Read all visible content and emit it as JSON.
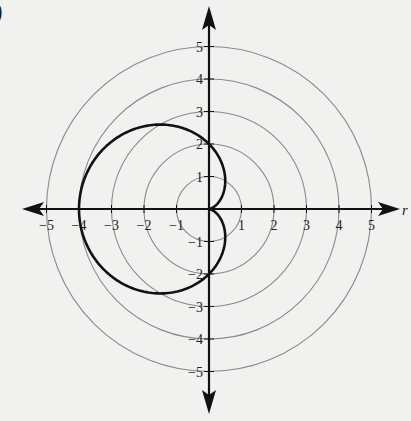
{
  "panel": {
    "label": ")"
  },
  "chart_data": {
    "type": "line",
    "subtype": "polar",
    "title": "",
    "equation": "r = 2 - 2cos(theta)",
    "curve_name": "cardioid",
    "xlabel": "r",
    "ylabel": "",
    "xlim": [
      -5,
      5
    ],
    "ylim": [
      -5,
      5
    ],
    "grid": "concentric circles r = 1..5",
    "grid_circles": [
      1,
      2,
      3,
      4,
      5
    ],
    "x_ticks": [
      -5,
      -4,
      -3,
      -2,
      -1,
      1,
      2,
      3,
      4,
      5
    ],
    "y_ticks": [
      -5,
      -4,
      -3,
      -2,
      -1,
      1,
      2,
      3,
      4,
      5
    ],
    "x_tick_labels": [
      "−5",
      "−4",
      "−3",
      "−2",
      "−1",
      "1",
      "2",
      "3",
      "4",
      "5"
    ],
    "y_tick_labels": [
      "−5",
      "−4",
      "−3",
      "−2",
      "−1",
      "1",
      "2",
      "3",
      "4",
      "5"
    ],
    "key_points": [
      {
        "theta": "0",
        "r": 0,
        "x": 0,
        "y": 0
      },
      {
        "theta": "pi/2",
        "r": 2,
        "x": 0,
        "y": 2
      },
      {
        "theta": "pi",
        "r": 4,
        "x": -4,
        "y": 0
      },
      {
        "theta": "3pi/2",
        "r": 2,
        "x": 0,
        "y": -2
      }
    ],
    "legend": null
  },
  "style": {
    "background": "#f1f1ef",
    "axis_color": "#111111",
    "grid_color": "#8a8a8a",
    "curve_color": "#111111",
    "text_color": "#222222"
  }
}
